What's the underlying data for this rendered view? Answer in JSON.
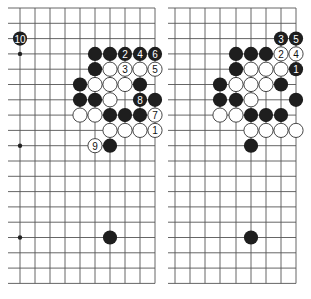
{
  "diagram": {
    "type": "go-board-diagrams",
    "colors": {
      "black_stone": "#1e1e1e",
      "white_stone": "#ffffff",
      "line": "#555555",
      "edge": "#222222"
    },
    "grid": {
      "rows": 19,
      "row_spacing": 15.3,
      "top_y": 8,
      "bottom_y": 283.4
    },
    "boards": [
      {
        "id": "left",
        "line_start_x": 8,
        "edge_x": 155,
        "columns_x": [
          20,
          35,
          50,
          65,
          80,
          95,
          110,
          125,
          140,
          155
        ],
        "hoshi": [
          [
            0,
            3
          ],
          [
            0,
            9
          ],
          [
            0,
            15
          ]
        ],
        "stones": [
          {
            "color": "B",
            "col": 0,
            "row": 2,
            "label": "10"
          },
          {
            "color": "B",
            "col": 5,
            "row": 3,
            "label": ""
          },
          {
            "color": "B",
            "col": 6,
            "row": 3,
            "label": ""
          },
          {
            "color": "B",
            "col": 7,
            "row": 3,
            "label": "2"
          },
          {
            "color": "B",
            "col": 8,
            "row": 3,
            "label": "4"
          },
          {
            "color": "B",
            "col": 9,
            "row": 3,
            "label": "6"
          },
          {
            "color": "B",
            "col": 5,
            "row": 4,
            "label": ""
          },
          {
            "color": "W",
            "col": 6,
            "row": 4,
            "label": ""
          },
          {
            "color": "W",
            "col": 7,
            "row": 4,
            "label": "3"
          },
          {
            "color": "W",
            "col": 8,
            "row": 4,
            "label": ""
          },
          {
            "color": "W",
            "col": 9,
            "row": 4,
            "label": "5"
          },
          {
            "color": "B",
            "col": 4,
            "row": 5,
            "label": ""
          },
          {
            "color": "W",
            "col": 5,
            "row": 5,
            "label": ""
          },
          {
            "color": "W",
            "col": 6,
            "row": 5,
            "label": ""
          },
          {
            "color": "W",
            "col": 7,
            "row": 5,
            "label": ""
          },
          {
            "color": "B",
            "col": 8,
            "row": 5,
            "label": ""
          },
          {
            "color": "B",
            "col": 4,
            "row": 6,
            "label": ""
          },
          {
            "color": "B",
            "col": 5,
            "row": 6,
            "label": ""
          },
          {
            "color": "W",
            "col": 6,
            "row": 6,
            "label": ""
          },
          {
            "color": "B",
            "col": 8,
            "row": 6,
            "label": "8"
          },
          {
            "color": "B",
            "col": 9,
            "row": 6,
            "label": ""
          },
          {
            "color": "W",
            "col": 4,
            "row": 7,
            "label": ""
          },
          {
            "color": "W",
            "col": 5,
            "row": 7,
            "label": ""
          },
          {
            "color": "B",
            "col": 6,
            "row": 7,
            "label": ""
          },
          {
            "color": "B",
            "col": 7,
            "row": 7,
            "label": ""
          },
          {
            "color": "B",
            "col": 8,
            "row": 7,
            "label": ""
          },
          {
            "color": "W",
            "col": 9,
            "row": 7,
            "label": "7"
          },
          {
            "color": "W",
            "col": 6,
            "row": 8,
            "label": ""
          },
          {
            "color": "W",
            "col": 7,
            "row": 8,
            "label": ""
          },
          {
            "color": "W",
            "col": 8,
            "row": 8,
            "label": ""
          },
          {
            "color": "W",
            "col": 9,
            "row": 8,
            "label": "1"
          },
          {
            "color": "W",
            "col": 5,
            "row": 9,
            "label": "9"
          },
          {
            "color": "B",
            "col": 6,
            "row": 9,
            "label": ""
          },
          {
            "color": "B",
            "col": 6,
            "row": 15,
            "label": ""
          }
        ]
      },
      {
        "id": "right",
        "line_start_x": 168,
        "edge_x": 296,
        "columns_x": [
          175,
          190,
          205,
          220,
          236,
          251,
          266,
          281,
          296
        ],
        "hoshi": [],
        "stones": [
          {
            "color": "B",
            "col": 7,
            "row": 2,
            "label": "3"
          },
          {
            "color": "B",
            "col": 8,
            "row": 2,
            "label": "5"
          },
          {
            "color": "B",
            "col": 4,
            "row": 3,
            "label": ""
          },
          {
            "color": "B",
            "col": 5,
            "row": 3,
            "label": ""
          },
          {
            "color": "B",
            "col": 6,
            "row": 3,
            "label": ""
          },
          {
            "color": "W",
            "col": 7,
            "row": 3,
            "label": "2"
          },
          {
            "color": "W",
            "col": 8,
            "row": 3,
            "label": "4"
          },
          {
            "color": "B",
            "col": 4,
            "row": 4,
            "label": ""
          },
          {
            "color": "W",
            "col": 5,
            "row": 4,
            "label": ""
          },
          {
            "color": "W",
            "col": 6,
            "row": 4,
            "label": ""
          },
          {
            "color": "W",
            "col": 7,
            "row": 4,
            "label": ""
          },
          {
            "color": "B",
            "col": 8,
            "row": 4,
            "label": "1"
          },
          {
            "color": "B",
            "col": 3,
            "row": 5,
            "label": ""
          },
          {
            "color": "W",
            "col": 4,
            "row": 5,
            "label": ""
          },
          {
            "color": "W",
            "col": 5,
            "row": 5,
            "label": ""
          },
          {
            "color": "W",
            "col": 6,
            "row": 5,
            "label": ""
          },
          {
            "color": "B",
            "col": 7,
            "row": 5,
            "label": ""
          },
          {
            "color": "B",
            "col": 3,
            "row": 6,
            "label": ""
          },
          {
            "color": "B",
            "col": 4,
            "row": 6,
            "label": ""
          },
          {
            "color": "W",
            "col": 5,
            "row": 6,
            "label": ""
          },
          {
            "color": "B",
            "col": 8,
            "row": 6,
            "label": ""
          },
          {
            "color": "W",
            "col": 3,
            "row": 7,
            "label": ""
          },
          {
            "color": "W",
            "col": 4,
            "row": 7,
            "label": ""
          },
          {
            "color": "B",
            "col": 5,
            "row": 7,
            "label": ""
          },
          {
            "color": "B",
            "col": 6,
            "row": 7,
            "label": ""
          },
          {
            "color": "B",
            "col": 7,
            "row": 7,
            "label": ""
          },
          {
            "color": "W",
            "col": 5,
            "row": 8,
            "label": ""
          },
          {
            "color": "W",
            "col": 6,
            "row": 8,
            "label": ""
          },
          {
            "color": "W",
            "col": 7,
            "row": 8,
            "label": ""
          },
          {
            "color": "W",
            "col": 8,
            "row": 8,
            "label": ""
          },
          {
            "color": "B",
            "col": 5,
            "row": 9,
            "label": ""
          },
          {
            "color": "B",
            "col": 5,
            "row": 15,
            "label": ""
          }
        ]
      }
    ]
  }
}
